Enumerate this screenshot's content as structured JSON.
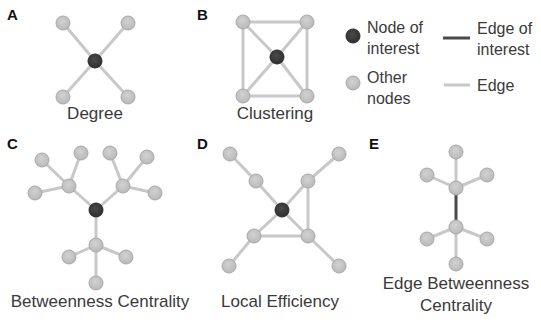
{
  "colors": {
    "node_of_interest": "#3d3d3d",
    "other_node": "#c4c4c4",
    "other_node_stroke": "#a9a9a9",
    "edge": "#c8c8c8",
    "edge_of_interest": "#4a4a4a"
  },
  "panels": [
    {
      "letter": "A",
      "caption": "Degree"
    },
    {
      "letter": "B",
      "caption": "Clustering"
    },
    {
      "letter": "C",
      "caption": "Betweenness Centrality"
    },
    {
      "letter": "D",
      "caption": "Local Efficiency"
    },
    {
      "letter": "E",
      "caption_line1": "Edge Betweenness",
      "caption_line2": "Centrality"
    }
  ],
  "legend": {
    "node_of_interest_line1": "Node of",
    "node_of_interest_line2": "interest",
    "other_nodes_line1": "Other",
    "other_nodes_line2": "nodes",
    "edge_of_interest_line1": "Edge of",
    "edge_of_interest_line2": "interest",
    "edge": "Edge"
  }
}
